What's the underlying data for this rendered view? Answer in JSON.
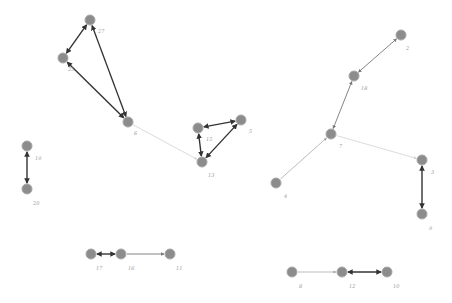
{
  "nodes": [
    {
      "id": "27",
      "x": 90,
      "y": 20,
      "lx": 98,
      "ly": 33
    },
    {
      "id": "25",
      "x": 63,
      "y": 58,
      "lx": 68,
      "ly": 71
    },
    {
      "id": "6",
      "x": 128,
      "y": 122,
      "lx": 134,
      "ly": 135
    },
    {
      "id": "15",
      "x": 198,
      "y": 128,
      "lx": 206,
      "ly": 141
    },
    {
      "id": "5",
      "x": 241,
      "y": 120,
      "lx": 249,
      "ly": 133
    },
    {
      "id": "13",
      "x": 202,
      "y": 162,
      "lx": 208,
      "ly": 177
    },
    {
      "id": "19",
      "x": 27,
      "y": 146,
      "lx": 35,
      "ly": 160
    },
    {
      "id": "20",
      "x": 27,
      "y": 189,
      "lx": 33,
      "ly": 205
    },
    {
      "id": "2",
      "x": 401,
      "y": 35,
      "lx": 406,
      "ly": 50
    },
    {
      "id": "18",
      "x": 354,
      "y": 76,
      "lx": 361,
      "ly": 90
    },
    {
      "id": "7",
      "x": 331,
      "y": 134,
      "lx": 339,
      "ly": 148
    },
    {
      "id": "3",
      "x": 422,
      "y": 160,
      "lx": 431,
      "ly": 174
    },
    {
      "id": "9",
      "x": 422,
      "y": 214,
      "lx": 429,
      "ly": 230
    },
    {
      "id": "4",
      "x": 276,
      "y": 183,
      "lx": 284,
      "ly": 198
    },
    {
      "id": "17",
      "x": 91,
      "y": 254,
      "lx": 96,
      "ly": 270
    },
    {
      "id": "16",
      "x": 121,
      "y": 254,
      "lx": 128,
      "ly": 270
    },
    {
      "id": "11",
      "x": 170,
      "y": 254,
      "lx": 176,
      "ly": 270
    },
    {
      "id": "8",
      "x": 292,
      "y": 272,
      "lx": 299,
      "ly": 288
    },
    {
      "id": "12",
      "x": 342,
      "y": 272,
      "lx": 349,
      "ly": 288
    },
    {
      "id": "10",
      "x": 387,
      "y": 272,
      "lx": 393,
      "ly": 288
    }
  ],
  "edges": [
    {
      "from": "27",
      "to": "25",
      "weight": "strong",
      "bidirectional": true
    },
    {
      "from": "27",
      "to": "6",
      "weight": "strong",
      "bidirectional": true
    },
    {
      "from": "25",
      "to": "6",
      "weight": "strong",
      "bidirectional": true
    },
    {
      "from": "6",
      "to": "13",
      "weight": "faint",
      "bidirectional": false
    },
    {
      "from": "15",
      "to": "5",
      "weight": "strong",
      "bidirectional": true
    },
    {
      "from": "15",
      "to": "13",
      "weight": "strong",
      "bidirectional": true
    },
    {
      "from": "5",
      "to": "13",
      "weight": "strong",
      "bidirectional": true
    },
    {
      "from": "19",
      "to": "20",
      "weight": "strong",
      "bidirectional": true
    },
    {
      "from": "2",
      "to": "18",
      "weight": "medium",
      "bidirectional": true
    },
    {
      "from": "18",
      "to": "7",
      "weight": "medium",
      "bidirectional": true
    },
    {
      "from": "4",
      "to": "7",
      "weight": "light",
      "bidirectional": false
    },
    {
      "from": "7",
      "to": "3",
      "weight": "faint",
      "bidirectional": false
    },
    {
      "from": "3",
      "to": "9",
      "weight": "strong",
      "bidirectional": true
    },
    {
      "from": "17",
      "to": "16",
      "weight": "strong",
      "bidirectional": true
    },
    {
      "from": "16",
      "to": "11",
      "weight": "medium",
      "bidirectional": false
    },
    {
      "from": "8",
      "to": "12",
      "weight": "light",
      "bidirectional": false
    },
    {
      "from": "12",
      "to": "10",
      "weight": "strong",
      "bidirectional": true
    }
  ],
  "styles": {
    "strong": {
      "color": "#333333",
      "width": 1.4
    },
    "medium": {
      "color": "#777777",
      "width": 0.9
    },
    "light": {
      "color": "#aaaaaa",
      "width": 0.8
    },
    "faint": {
      "color": "#cccccc",
      "width": 0.7
    }
  }
}
